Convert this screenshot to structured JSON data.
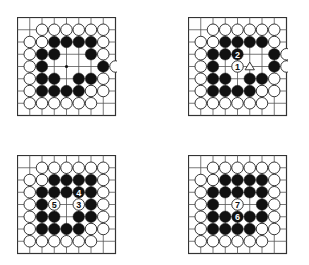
{
  "figure": {
    "type": "go-diagram-sequence",
    "grid_lines": 9,
    "colors": {
      "line": "#555555",
      "black": "#111111",
      "white": "#ffffff",
      "star": "#111111"
    }
  },
  "boards": [
    {
      "id": "board-1",
      "position": {
        "x": 17,
        "y": 17
      },
      "rows": [
        ".........",
        "..WWWWWW.",
        ".WWBBBBW.",
        ".WBB..BW.",
        ".WB....BW",
        ".WBB.BBW.",
        ".WBBBBWW.",
        ".WWWWWW..",
        "........."
      ],
      "star_points": [
        [
          4,
          4
        ]
      ],
      "marks": []
    },
    {
      "id": "board-2",
      "position": {
        "x": 188,
        "y": 17
      },
      "rows": [
        ".........",
        "..WWWWWW.",
        ".WWBBBBW.",
        ".WBBB..BW",
        ".WB.W..BW",
        ".WBB.BBW.",
        ".WBBBBWW.",
        ".WWWWWW..",
        "........."
      ],
      "star_points": [],
      "marks": [
        {
          "row": 4,
          "col": 4,
          "label": "1",
          "stone": "W"
        },
        {
          "row": 3,
          "col": 4,
          "label": "2",
          "stone": "B"
        },
        {
          "row": 4,
          "col": 5,
          "label": "△",
          "stone": "none"
        }
      ]
    },
    {
      "id": "board-3",
      "position": {
        "x": 17,
        "y": 155
      },
      "rows": [
        ".........",
        "..WWWWWW.",
        ".WWBBBBW.",
        ".WBBBBBW.",
        ".WBW.WBW.",
        ".WBB.BBW.",
        ".WBBBBWW.",
        ".WWWWWW..",
        "........."
      ],
      "star_points": [],
      "marks": [
        {
          "row": 3,
          "col": 5,
          "label": "4",
          "stone": "B"
        },
        {
          "row": 4,
          "col": 5,
          "label": "3",
          "stone": "W"
        },
        {
          "row": 4,
          "col": 3,
          "label": "5",
          "stone": "W"
        }
      ]
    },
    {
      "id": "board-4",
      "position": {
        "x": 188,
        "y": 155
      },
      "rows": [
        ".........",
        "..WWWWWW.",
        ".WWBBBBW.",
        ".WBBBBBW.",
        ".WB.W.BW.",
        ".WBBBBBW.",
        ".WBBBBWW.",
        ".WWWWWW..",
        "........."
      ],
      "star_points": [],
      "marks": [
        {
          "row": 4,
          "col": 4,
          "label": "7",
          "stone": "W"
        },
        {
          "row": 5,
          "col": 4,
          "label": "6",
          "stone": "B"
        }
      ]
    }
  ]
}
